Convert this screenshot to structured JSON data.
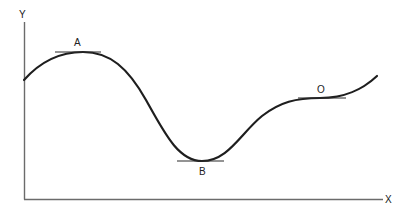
{
  "diagram": {
    "axes": {
      "x_label": "X",
      "y_label": "Y"
    },
    "points": [
      {
        "id": "A",
        "label": "A",
        "kind": "maximum"
      },
      {
        "id": "B",
        "label": "B",
        "kind": "minimum"
      },
      {
        "id": "O",
        "label": "O",
        "kind": "point of inflection"
      }
    ]
  }
}
